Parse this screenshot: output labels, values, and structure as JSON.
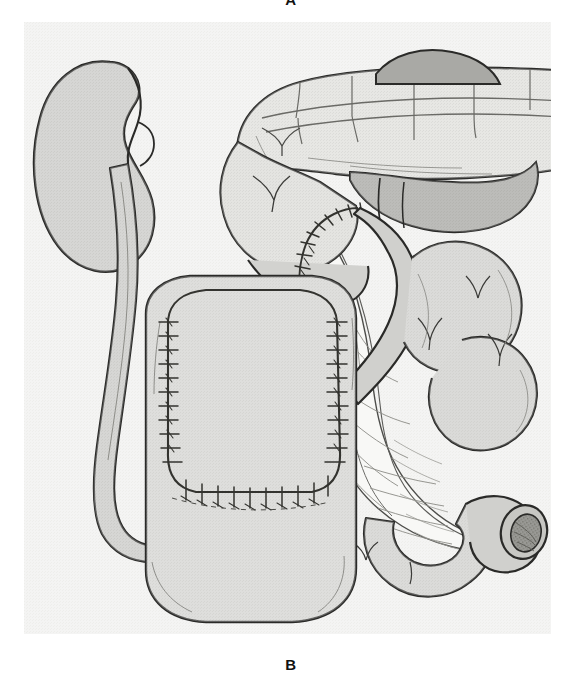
{
  "figure": {
    "kind": "medical-surgical-illustration",
    "panel_labels": {
      "top": "A",
      "bottom": "B"
    },
    "caption_visible": false,
    "palette": {
      "page_background": "#ffffff",
      "panel_background": "#f2f2f0",
      "organ_fill_light": "#d6d6d4",
      "organ_fill_mid": "#c9c9c6",
      "organ_fill_dark": "#b0b0ac",
      "mesentery_fill": "#f7f7f5",
      "outline": "#2a2a28",
      "outline_soft": "#6e6e6a",
      "suture_color": "#3a3a37",
      "lumen_dark": "#8e8e8a",
      "label_color": "#111111"
    },
    "panel_rect": {
      "x": 24,
      "y": 10,
      "width": 527,
      "height": 612
    }
  },
  "anatomy": {
    "structures": [
      {
        "id": "kidney",
        "label": "Kidney",
        "region": "upper-left",
        "tone": "organ_fill_mid"
      },
      {
        "id": "renal-hilum",
        "label": "Renal hilum",
        "region": "upper-left",
        "tone": "organ_fill_mid"
      },
      {
        "id": "ureter",
        "label": "Ureter",
        "region": "left",
        "tone": "organ_fill_mid"
      },
      {
        "id": "bladder",
        "label": "Bladder",
        "region": "lower-centre-left",
        "tone": "organ_fill_light"
      },
      {
        "id": "bowel-patch",
        "label": "Bowel patch on bladder",
        "region": "lower-centre-left",
        "tone": "organ_fill_light"
      },
      {
        "id": "patch-suture-line",
        "label": "Patch suture line",
        "region": "lower-centre-left",
        "tone": "suture_color"
      },
      {
        "id": "transverse-colon",
        "label": "Transverse colon",
        "region": "top",
        "tone": "organ_fill_light"
      },
      {
        "id": "haustra",
        "label": "Haustral sacculations",
        "region": "top",
        "tone": "outline_soft"
      },
      {
        "id": "taenia-coli",
        "label": "Taenia coli",
        "region": "top",
        "tone": "outline_soft"
      },
      {
        "id": "posterior-loop",
        "label": "Bowel loop behind colon",
        "region": "top-right",
        "tone": "organ_fill_dark"
      },
      {
        "id": "bowel-anastomosis",
        "label": "Bowel anastomosis suture line",
        "region": "upper-centre",
        "tone": "suture_color"
      },
      {
        "id": "mesentery",
        "label": "Mesentery with vascular arcade",
        "region": "centre-right",
        "tone": "mesentery_fill"
      },
      {
        "id": "descending-limb",
        "label": "Descending bowel limb",
        "region": "right",
        "tone": "organ_fill_mid"
      },
      {
        "id": "distal-loop",
        "label": "Distal bowel loop",
        "region": "lower-right",
        "tone": "organ_fill_mid"
      },
      {
        "id": "transected-end",
        "label": "Open transected bowel end",
        "region": "lower-right",
        "tone": "lumen_dark"
      }
    ]
  }
}
